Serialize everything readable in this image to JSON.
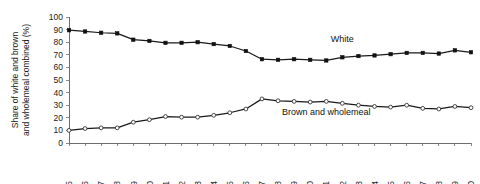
{
  "chart_data": {
    "type": "line",
    "title": "",
    "xlabel": "",
    "ylabel": "Share of white and brown and wholemeal combined (%)",
    "ylim": [
      0,
      100
    ],
    "yticks": [
      0,
      10,
      20,
      30,
      40,
      50,
      60,
      70,
      80,
      90,
      100
    ],
    "grid": false,
    "legend_position": "inline-annotations",
    "categories": [
      "1975",
      "1976",
      "1977",
      "1978",
      "1979",
      "1980",
      "1981",
      "1982",
      "1983",
      "1984",
      "1985",
      "1986",
      "1987",
      "1988",
      "1989",
      "1990",
      "1991",
      "1992",
      "1993",
      "1994",
      "1995",
      "1996",
      "1997",
      "1998",
      "1999",
      "2000"
    ],
    "series": [
      {
        "name": "White",
        "marker": "filled-square",
        "values": [
          89.5,
          88.5,
          87.5,
          87.0,
          82.0,
          81.0,
          79.5,
          79.5,
          80.0,
          78.5,
          77.0,
          73.0,
          66.5,
          66.0,
          66.5,
          66.0,
          65.5,
          68.0,
          69.0,
          69.5,
          70.5,
          71.5,
          71.5,
          71.0,
          73.5,
          72.0
        ]
      },
      {
        "name": "Brown and wholemeal",
        "marker": "open-circle",
        "values": [
          10.0,
          11.5,
          12.0,
          12.0,
          16.5,
          18.5,
          21.0,
          20.5,
          20.5,
          22.0,
          24.0,
          27.0,
          35.0,
          33.5,
          33.0,
          32.5,
          33.0,
          31.5,
          30.0,
          29.0,
          28.5,
          30.0,
          27.5,
          27.0,
          29.0,
          28.0
        ]
      }
    ],
    "annotations": [
      {
        "text": "White",
        "x_category": "1992",
        "y_value": 80
      },
      {
        "text": "Brown and wholemeal",
        "x_category": "1991",
        "y_value": 22
      }
    ]
  }
}
